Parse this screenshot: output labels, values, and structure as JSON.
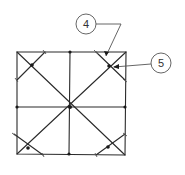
{
  "diagram": {
    "type": "square grid with diagonals and corner cross-braces",
    "callouts": [
      {
        "id": "callout-4",
        "label": "4",
        "cx": 86,
        "cy": 24
      },
      {
        "id": "callout-5",
        "label": "5",
        "cx": 161,
        "cy": 63
      }
    ],
    "colors": {
      "line": "#2a2a2a",
      "background": "#ffffff"
    }
  }
}
